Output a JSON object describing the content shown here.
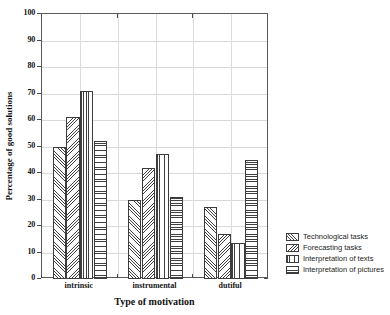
{
  "chart_data": {
    "type": "bar",
    "title": "",
    "xlabel": "Type of motivation",
    "ylabel": "Percentage of good solutions",
    "ylim": [
      0,
      100
    ],
    "ytick_step": 10,
    "yticks": [
      0,
      10,
      20,
      30,
      40,
      50,
      60,
      70,
      80,
      90,
      100
    ],
    "grid": true,
    "legend_position": "right",
    "categories": [
      "intrinsic",
      "instrumental",
      "dutiful"
    ],
    "series": [
      {
        "name": "Technological tasks",
        "pattern": "diagonal-up-hatch",
        "values": [
          50,
          30,
          27
        ]
      },
      {
        "name": "Forecasting tasks",
        "pattern": "diagonal-down-hatch",
        "values": [
          61,
          42,
          17
        ]
      },
      {
        "name": "Interpretation of texts",
        "pattern": "vertical-lines",
        "values": [
          71,
          47,
          13.5
        ]
      },
      {
        "name": "Interpretation of pictures",
        "pattern": "horizontal-lines",
        "values": [
          52,
          31,
          45
        ]
      }
    ]
  },
  "axes": {
    "y_tick_labels": [
      "0",
      "10",
      "20",
      "30",
      "40",
      "50",
      "60",
      "70",
      "80",
      "90",
      "100"
    ],
    "x_tick_labels": [
      "intrinsic",
      "instrumental",
      "dutiful"
    ]
  },
  "legend": {
    "items": [
      {
        "label": "Technological tasks"
      },
      {
        "label": "Forecasting tasks"
      },
      {
        "label": "Interpretation of texts"
      },
      {
        "label": "Interpretation of pictures"
      }
    ]
  },
  "colors": {
    "axis": "#5a5a5a",
    "grid": "#d8d8d8",
    "hatch": "#3f3f3f",
    "bar_fill": "#fdfdfd",
    "text": "#121212"
  }
}
